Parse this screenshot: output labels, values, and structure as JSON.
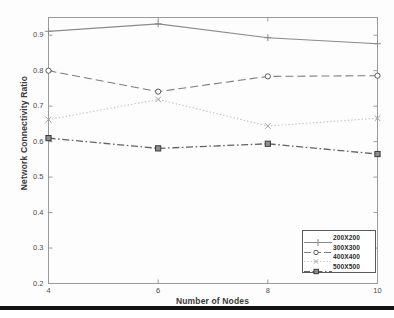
{
  "chart_data": {
    "type": "line",
    "title": "",
    "xlabel": "Number of Nodes",
    "ylabel": "Network Connectivity Ratio",
    "x": [
      4,
      6,
      8,
      10
    ],
    "xlim": [
      4,
      10
    ],
    "ylim": [
      0.2,
      0.95
    ],
    "xticks": [
      "4",
      "6",
      "8",
      "10"
    ],
    "yticks": [
      "0.2",
      "0.3",
      "0.4",
      "0.5",
      "0.6",
      "0.7",
      "0.8",
      "0.9"
    ],
    "grid": false,
    "legend_position": "lower right",
    "series": [
      {
        "name": "200X200",
        "values": [
          0.911,
          0.932,
          0.893,
          0.876
        ],
        "color": "#8a8a8a",
        "linestyle": "solid",
        "marker": "plus"
      },
      {
        "name": "300X300",
        "values": [
          0.8,
          0.741,
          0.784,
          0.786
        ],
        "color": "#7d7d7d",
        "linestyle": "dashed",
        "marker": "circle"
      },
      {
        "name": "400X400",
        "values": [
          0.662,
          0.719,
          0.644,
          0.666
        ],
        "color": "#bfbfbf",
        "linestyle": "dotted",
        "marker": "cross"
      },
      {
        "name": "500X500",
        "values": [
          0.61,
          0.581,
          0.594,
          0.565
        ],
        "color": "#636363",
        "linestyle": "dashdot",
        "marker": "square"
      }
    ]
  },
  "axes": {
    "frame_color": "#9a9a9a"
  }
}
